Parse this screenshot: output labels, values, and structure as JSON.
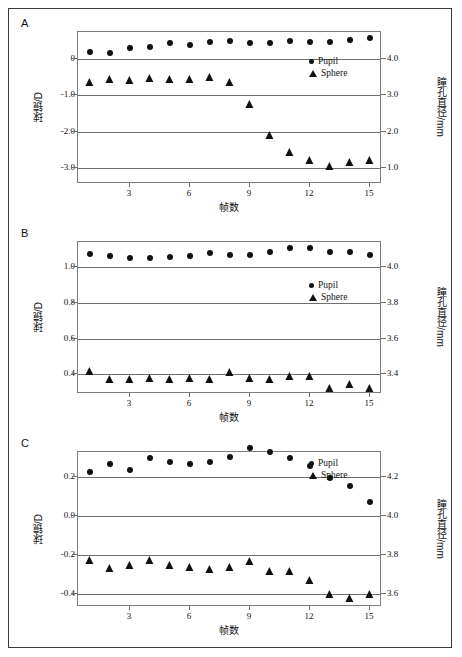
{
  "figure": {
    "panels": [
      "A",
      "B",
      "C"
    ],
    "xlabel": "帧数",
    "ylabel_left": "球镜/D",
    "ylabel_right": "瞳孔直径/mm",
    "legend": [
      {
        "marker": "circle-marker",
        "label": "Pupil"
      },
      {
        "marker": "triangle-marker",
        "label": "Sphere"
      }
    ],
    "xticks": [
      "3",
      "6",
      "9",
      "12",
      "15"
    ]
  },
  "chart_data": [
    {
      "type": "scatter",
      "panel": "A",
      "title": "A",
      "xlabel": "帧数",
      "ylabel": "球镜/D",
      "ylabel2": "瞳孔直径/mm",
      "x": [
        1,
        2,
        3,
        4,
        5,
        6,
        7,
        8,
        9,
        10,
        11,
        12,
        13,
        14,
        15
      ],
      "xlim": [
        0.4,
        15.6
      ],
      "ylim": [
        -3.45,
        0.75
      ],
      "ylim2": [
        0.55,
        4.75
      ],
      "yticks": [
        "0",
        "-1.0",
        "-2.0",
        "-3.0"
      ],
      "ytickvalues": [
        0,
        -1.0,
        -2.0,
        -3.0
      ],
      "ytticks2": [
        "4.0",
        "3.0",
        "2.0",
        "1.0"
      ],
      "ytickvalues2": [
        4.0,
        3.0,
        2.0,
        1.0
      ],
      "grid": true,
      "legend_position": "upper-right",
      "series": [
        {
          "name": "Pupil",
          "marker": "circle-marker",
          "axis": "right",
          "values": [
            4.2,
            4.17,
            4.3,
            4.34,
            4.44,
            4.39,
            4.48,
            4.5,
            4.44,
            4.45,
            4.5,
            4.47,
            4.48,
            4.53,
            4.58
          ]
        },
        {
          "name": "Sphere",
          "marker": "triangle-marker",
          "axis": "left",
          "values": [
            -0.67,
            -0.58,
            -0.6,
            -0.56,
            -0.57,
            -0.57,
            -0.52,
            -0.66,
            -1.27,
            -2.12,
            -2.58,
            -2.82,
            -2.98,
            -2.87,
            -2.81
          ]
        }
      ]
    },
    {
      "type": "scatter",
      "panel": "B",
      "title": "B",
      "xlabel": "帧数",
      "ylabel": "球镜/D",
      "ylabel2": "瞳孔直径/mm",
      "x": [
        1,
        2,
        3,
        4,
        5,
        6,
        7,
        8,
        9,
        10,
        11,
        12,
        13,
        14,
        15
      ],
      "xlim": [
        0.4,
        15.6
      ],
      "ylim": [
        0.29,
        1.14
      ],
      "ylim2": [
        3.29,
        4.14
      ],
      "yticks": [
        "1.0",
        "0.8",
        "0.6",
        "0.4"
      ],
      "ytickvalues": [
        1.0,
        0.8,
        0.6,
        0.4
      ],
      "ytticks2": [
        "4.0",
        "3.8",
        "3.6",
        "3.4"
      ],
      "ytickvalues2": [
        4.0,
        3.8,
        3.6,
        3.4
      ],
      "grid": true,
      "legend_position": "upper-right",
      "series": [
        {
          "name": "Pupil",
          "marker": "circle-marker",
          "axis": "right",
          "values": [
            4.075,
            4.06,
            4.05,
            4.05,
            4.058,
            4.06,
            4.077,
            4.07,
            4.068,
            4.085,
            4.105,
            4.105,
            4.085,
            4.085,
            4.068
          ]
        },
        {
          "name": "Sphere",
          "marker": "triangle-marker",
          "axis": "left",
          "values": [
            0.415,
            0.368,
            0.368,
            0.375,
            0.368,
            0.373,
            0.367,
            0.405,
            0.374,
            0.367,
            0.383,
            0.385,
            0.32,
            0.34,
            0.317
          ]
        }
      ]
    },
    {
      "type": "scatter",
      "panel": "C",
      "title": "C",
      "xlabel": "帧数",
      "ylabel": "球镜/D",
      "ylabel2": "瞳孔直径/mm",
      "x": [
        1,
        2,
        3,
        4,
        5,
        6,
        7,
        8,
        9,
        10,
        11,
        12,
        13,
        14,
        15
      ],
      "xlim": [
        0.4,
        15.6
      ],
      "ylim": [
        -0.465,
        0.325
      ],
      "ylim2": [
        3.535,
        4.325
      ],
      "yticks": [
        "0.2",
        "0.0",
        "-0.2",
        "-0.4"
      ],
      "ytickvalues": [
        0.2,
        0.0,
        -0.2,
        -0.4
      ],
      "ytticks2": [
        "4.2",
        "4.0",
        "3.8",
        "3.6"
      ],
      "ytickvalues2": [
        4.2,
        4.0,
        3.8,
        3.6
      ],
      "grid": true,
      "legend_position": "upper-right",
      "series": [
        {
          "name": "Pupil",
          "marker": "circle-marker",
          "axis": "right",
          "values": [
            4.222,
            4.262,
            4.232,
            4.295,
            4.272,
            4.262,
            4.272,
            4.302,
            4.345,
            4.327,
            4.293,
            4.252,
            4.193,
            4.15,
            4.07
          ]
        },
        {
          "name": "Sphere",
          "marker": "triangle-marker",
          "axis": "left",
          "values": [
            -0.233,
            -0.272,
            -0.258,
            -0.233,
            -0.255,
            -0.267,
            -0.275,
            -0.265,
            -0.236,
            -0.287,
            -0.287,
            -0.335,
            -0.405,
            -0.425,
            -0.405
          ]
        }
      ]
    }
  ]
}
